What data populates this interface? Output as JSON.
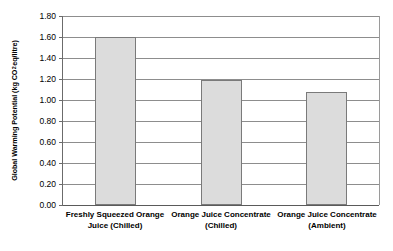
{
  "chart_data": {
    "type": "bar",
    "title": "",
    "xlabel": "",
    "ylabel": "Global Warming Potential (kg CO2 eq/litre)",
    "ylabel_prefix": "Global Warming Potential (kg CO",
    "ylabel_subscript": "2",
    "ylabel_suffix": " eq/litre)",
    "categories": [
      "Freshly Squeezed Orange Juice (Chilled)",
      "Orange Juice Concentrate (Chilled)",
      "Orange Juice Concentrate (Ambient)"
    ],
    "values": [
      1.6,
      1.19,
      1.08
    ],
    "ylim": [
      0.0,
      1.8
    ],
    "ytick_step": 0.2,
    "ytick_labels": [
      "1.80",
      "1.60",
      "1.40",
      "1.20",
      "1.00",
      "0.80",
      "0.60",
      "0.40",
      "0.20",
      "0.00"
    ],
    "ytick_values": [
      1.8,
      1.6,
      1.4,
      1.2,
      1.0,
      0.8,
      0.6,
      0.4,
      0.2,
      0.0
    ],
    "grid": true,
    "legend": false,
    "bar_color": "#dcdcdc",
    "bar_border_color": "#7a7a7a",
    "gridline_color": "#8d8d8d",
    "axis_color": "#5a5a5a",
    "background": "#ffffff"
  }
}
